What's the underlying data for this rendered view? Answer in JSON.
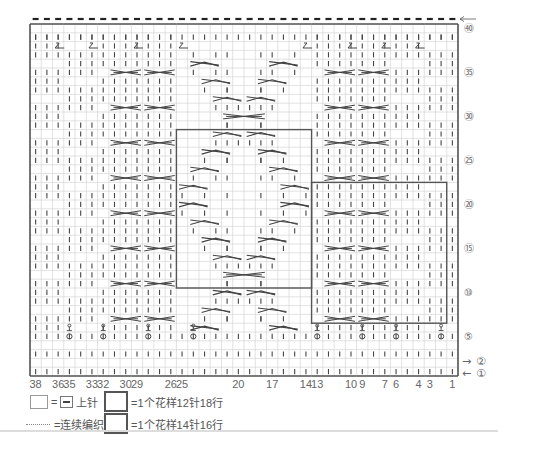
{
  "chart_data": {
    "type": "knitting-chart",
    "title": "",
    "columns": 38,
    "rows": 40,
    "column_labels": [
      {
        "col": 38,
        "label": "38"
      },
      {
        "col": 36,
        "label": "36"
      },
      {
        "col": 35,
        "label": "35"
      },
      {
        "col": 33,
        "label": "33"
      },
      {
        "col": 32,
        "label": "32"
      },
      {
        "col": 30,
        "label": "30"
      },
      {
        "col": 29,
        "label": "29"
      },
      {
        "col": 26,
        "label": "26"
      },
      {
        "col": 25,
        "label": "25"
      },
      {
        "col": 20,
        "label": "20"
      },
      {
        "col": 17,
        "label": "17"
      },
      {
        "col": 14,
        "label": "14"
      },
      {
        "col": 13,
        "label": "13"
      },
      {
        "col": 10,
        "label": "10"
      },
      {
        "col": 9,
        "label": "9"
      },
      {
        "col": 7,
        "label": "7"
      },
      {
        "col": 6,
        "label": "6"
      },
      {
        "col": 4,
        "label": "4"
      },
      {
        "col": 3,
        "label": "3"
      },
      {
        "col": 1,
        "label": "1"
      }
    ],
    "row_labels": [
      {
        "row": 40,
        "label": "㊵"
      },
      {
        "row": 35,
        "label": "㉟"
      },
      {
        "row": 30,
        "label": "㉚"
      },
      {
        "row": 25,
        "label": "㉕"
      },
      {
        "row": 20,
        "label": "⑳"
      },
      {
        "row": 15,
        "label": "⑮"
      },
      {
        "row": 10,
        "label": "⑩"
      },
      {
        "row": 5,
        "label": "⑤"
      },
      {
        "row": 2,
        "label": "②",
        "arrow": "→"
      },
      {
        "row": 1,
        "label": "①",
        "arrow": "←"
      }
    ],
    "top_arrow": "←",
    "bind_off_groups": [
      [
        36,
        38
      ],
      [
        33,
        35
      ],
      [
        30,
        32
      ],
      [
        26,
        29
      ],
      [
        14,
        25
      ],
      [
        10,
        13
      ],
      [
        7,
        9
      ],
      [
        4,
        6
      ],
      [
        1,
        3
      ]
    ],
    "gap_columns": [
      37.5,
      33.5,
      29.5,
      25.5,
      13.5,
      9.5,
      6.5,
      3.5
    ],
    "decrease_row": 38,
    "decrease_cols": [
      36,
      33,
      29,
      25,
      14,
      10,
      7,
      4
    ],
    "yarnover_row": 5,
    "yarnover_cols": [
      35,
      32,
      28,
      24,
      13,
      9,
      6,
      2
    ],
    "pattern_box_12x18": {
      "col_from": 25,
      "col_to": 14,
      "row_from": 11,
      "row_to": 28
    },
    "pattern_box_14x16": {
      "col_from": 13,
      "col_to": 2,
      "row_from": 7,
      "row_to": 22
    },
    "cable_rows_side": [
      7,
      11,
      15,
      19,
      23,
      27,
      31,
      35
    ],
    "cable_groups_side": [
      [
        32,
        29
      ],
      [
        29,
        26
      ],
      [
        13,
        10
      ],
      [
        9,
        6
      ]
    ],
    "center_diamond_rows": [
      {
        "row": 36,
        "crosses": [
          [
            24,
            22
          ],
          [
            17,
            15
          ]
        ]
      },
      {
        "row": 34,
        "crosses": [
          [
            23,
            21
          ],
          [
            18,
            16
          ]
        ]
      },
      {
        "row": 32,
        "crosses": [
          [
            22,
            20
          ],
          [
            19,
            17
          ]
        ]
      },
      {
        "row": 30,
        "cable": [
          21,
          18
        ]
      },
      {
        "row": 28,
        "crosses": [
          [
            22,
            20
          ],
          [
            19,
            17
          ]
        ]
      },
      {
        "row": 26,
        "crosses": [
          [
            23,
            21
          ],
          [
            18,
            16
          ]
        ]
      },
      {
        "row": 24,
        "crosses": [
          [
            24,
            22
          ],
          [
            17,
            15
          ]
        ]
      },
      {
        "row": 22,
        "crosses": [
          [
            25,
            23
          ],
          [
            16,
            14
          ]
        ]
      },
      {
        "row": 20,
        "crosses": [
          [
            25,
            23
          ],
          [
            16,
            14
          ]
        ]
      },
      {
        "row": 18,
        "crosses": [
          [
            24,
            22
          ],
          [
            17,
            15
          ]
        ]
      },
      {
        "row": 16,
        "crosses": [
          [
            23,
            21
          ],
          [
            18,
            16
          ]
        ]
      },
      {
        "row": 14,
        "crosses": [
          [
            22,
            20
          ],
          [
            19,
            17
          ]
        ]
      },
      {
        "row": 12,
        "cable": [
          21,
          18
        ]
      },
      {
        "row": 10,
        "crosses": [
          [
            22,
            20
          ],
          [
            19,
            17
          ]
        ]
      },
      {
        "row": 8,
        "crosses": [
          [
            23,
            21
          ],
          [
            18,
            16
          ]
        ]
      },
      {
        "row": 6,
        "crosses": [
          [
            24,
            22
          ],
          [
            17,
            15
          ]
        ]
      }
    ]
  },
  "legend": {
    "purl_equals": "=",
    "purl_label": "上针",
    "pattern12_label": "=1个花样12针18行",
    "continue_label": "=连续编织",
    "pattern14_label": "=1个花样14针16行"
  },
  "colors": {
    "grid": "#cfcfcf",
    "border": "#555555",
    "symbol": "#444444",
    "label": "#666666"
  }
}
